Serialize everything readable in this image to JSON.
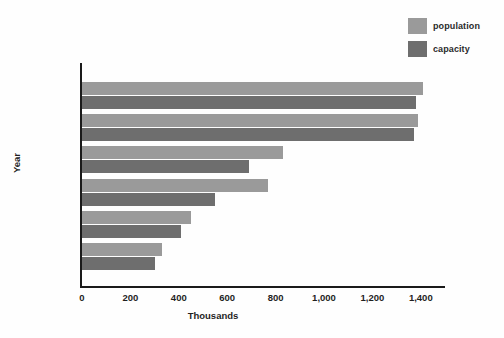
{
  "chart_data": {
    "type": "bar",
    "orientation": "horizontal",
    "title": "",
    "subtitle": "",
    "xlabel": "Thousands",
    "ylabel": "Year",
    "categories": [
      "2010",
      "2000",
      "1995",
      "1990",
      "1985",
      "1980"
    ],
    "series": [
      {
        "name": "population",
        "color": "#9a9a9a",
        "values": [
          1410,
          1390,
          830,
          770,
          450,
          330
        ]
      },
      {
        "name": "capacity",
        "color": "#6e6e6e",
        "values": [
          1380,
          1370,
          690,
          550,
          410,
          300
        ]
      }
    ],
    "xlim": [
      0,
      1500
    ],
    "xticks": [
      0,
      200,
      400,
      600,
      800,
      1000,
      1200,
      1400
    ],
    "xtick_labels": [
      "0",
      "200",
      "400",
      "600",
      "800",
      "1,000",
      "1,200",
      "1,400"
    ],
    "grid": false,
    "legend_position": "top-right",
    "axis_color": "#1a1a1a",
    "background": "#fefefe"
  },
  "legend": {
    "items": [
      {
        "label": "population",
        "color": "#9a9a9a"
      },
      {
        "label": "capacity",
        "color": "#6e6e6e"
      }
    ]
  }
}
